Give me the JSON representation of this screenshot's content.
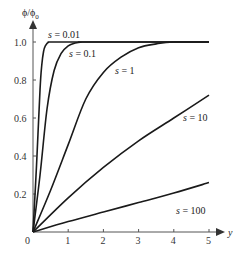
{
  "chart_data": {
    "type": "line",
    "title": "",
    "xlabel": "y",
    "ylabel": "ϕ/ϕ₀",
    "xlim": [
      0,
      5
    ],
    "ylim": [
      0,
      1.0
    ],
    "grid": false,
    "legend_position": "inline labels",
    "x_ticks": [
      "0",
      "1",
      "2",
      "3",
      "4",
      "5"
    ],
    "y_ticks": [
      "0.2",
      "0.4",
      "0.6",
      "0.8",
      "1.0"
    ],
    "series": [
      {
        "name": "s = 0.01",
        "label": "s = 0.01",
        "x": [
          0,
          0.1,
          0.2,
          0.25,
          0.3,
          0.35,
          0.45,
          0.6,
          0.8,
          5
        ],
        "y": [
          0,
          0.35,
          0.75,
          0.88,
          0.95,
          0.98,
          1.0,
          1.0,
          1.0,
          1.0
        ]
      },
      {
        "name": "s = 0.1",
        "label": "s = 0.1",
        "x": [
          0,
          0.2,
          0.4,
          0.6,
          0.8,
          1.0,
          1.2,
          1.4,
          1.6,
          5
        ],
        "y": [
          0,
          0.3,
          0.65,
          0.85,
          0.94,
          0.98,
          0.995,
          1.0,
          1.0,
          1.0
        ]
      },
      {
        "name": "s = 1",
        "label": "s = 1",
        "x": [
          0,
          0.5,
          1.0,
          1.5,
          2.0,
          2.5,
          3.0,
          3.5,
          4.0,
          5
        ],
        "y": [
          0,
          0.22,
          0.46,
          0.7,
          0.84,
          0.92,
          0.97,
          0.99,
          1.0,
          1.0
        ]
      },
      {
        "name": "s = 10",
        "label": "s = 10",
        "x": [
          0,
          1,
          2,
          3,
          4,
          5
        ],
        "y": [
          0,
          0.18,
          0.34,
          0.48,
          0.6,
          0.72
        ]
      },
      {
        "name": "s = 100",
        "label": "s = 100",
        "x": [
          0,
          1,
          2,
          3,
          4,
          5
        ],
        "y": [
          0,
          0.055,
          0.105,
          0.155,
          0.205,
          0.26
        ]
      }
    ]
  },
  "axes": {
    "x_label": "y",
    "y_label_main": "ϕ/ϕ",
    "y_label_sub": "0",
    "origin_label": "0"
  }
}
